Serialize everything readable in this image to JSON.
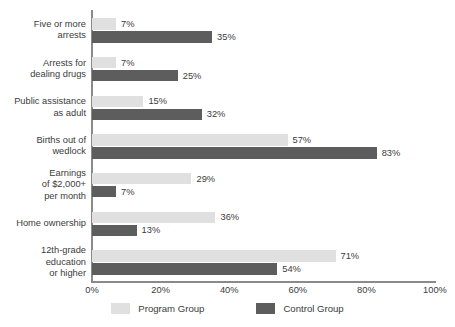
{
  "chart_data": {
    "type": "bar",
    "orientation": "horizontal",
    "title": "",
    "xlabel": "",
    "ylabel": "",
    "xlim": [
      0,
      100
    ],
    "x_ticks": [
      "0%",
      "20%",
      "40%",
      "60%",
      "80%",
      "100%"
    ],
    "x_tick_values": [
      0,
      20,
      40,
      60,
      80,
      100
    ],
    "grid": false,
    "legend_position": "bottom",
    "value_suffix": "%",
    "categories": [
      "Five or more\narrests",
      "Arrests for\ndealing drugs",
      "Public assistance\nas adult",
      "Births out of\nwedlock",
      "Earnings\nof $2,000+\nper month",
      "Home ownership",
      "12th-grade\neducation\nor higher"
    ],
    "series": [
      {
        "name": "Program Group",
        "color": "#e0e0e0",
        "values": [
          7,
          7,
          15,
          57,
          29,
          36,
          71
        ],
        "labels": [
          "7%",
          "7%",
          "15%",
          "57%",
          "29%",
          "36%",
          "71%"
        ]
      },
      {
        "name": "Control Group",
        "color": "#5d5d5d",
        "values": [
          35,
          25,
          32,
          83,
          7,
          13,
          54
        ],
        "labels": [
          "35%",
          "25%",
          "32%",
          "83%",
          "7%",
          "13%",
          "54%"
        ]
      }
    ]
  },
  "legend": {
    "items": [
      {
        "label": "Program Group",
        "swatch": "program"
      },
      {
        "label": "Control Group",
        "swatch": "control"
      }
    ]
  }
}
